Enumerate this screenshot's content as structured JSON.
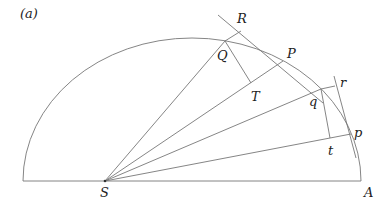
{
  "figure": {
    "panel_label": "(a)",
    "labels": {
      "R": "R",
      "Q": "Q",
      "P": "P",
      "T": "T",
      "q": "q",
      "r": "r",
      "p": "p",
      "t": "t",
      "S": "S",
      "A": "A"
    },
    "colors": {
      "line": "#777777",
      "text": "#222222",
      "background": "#ffffff"
    }
  }
}
